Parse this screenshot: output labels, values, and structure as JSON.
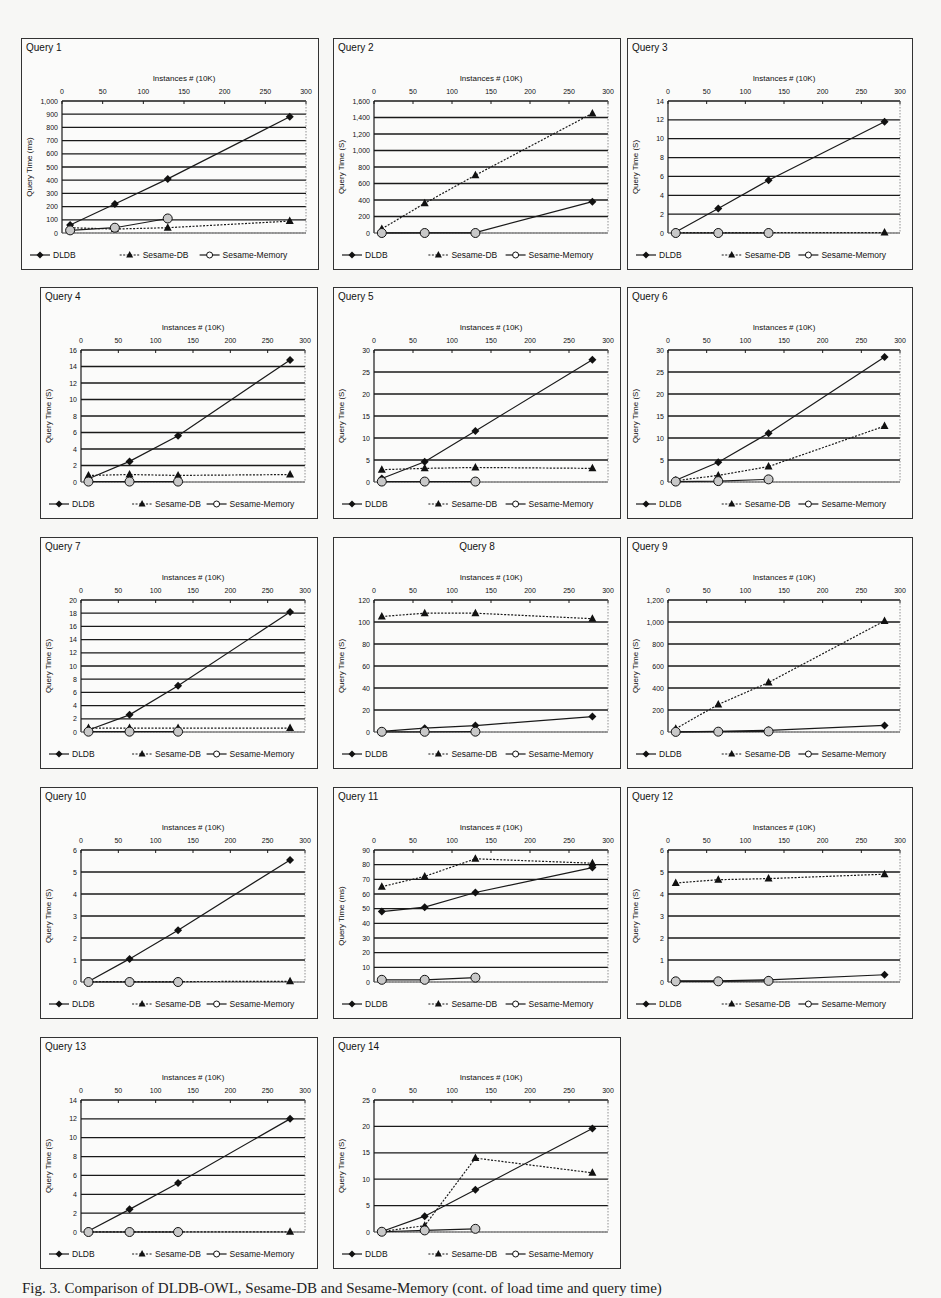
{
  "figure": {
    "caption": "Fig. 3. Comparison of DLDB-OWL, Sesame-DB and Sesame-Memory (cont. of load time and query time)",
    "legend": [
      "DLDB",
      "Sesame-DB",
      "Sesame-Memory"
    ],
    "x_axis_label": "Instances # (10K)",
    "x_ticks": [
      0,
      50,
      100,
      150,
      200,
      250,
      300
    ]
  },
  "chart_data": [
    {
      "type": "line",
      "title": "Query 1",
      "xlabel": "Instances # (10K)",
      "ylabel": "Query Time (ms)",
      "ylim": [
        0,
        1000
      ],
      "yticks": [
        0,
        100,
        200,
        300,
        400,
        500,
        600,
        700,
        800,
        900,
        1000
      ],
      "ytick_labels": [
        "0",
        "100",
        "200",
        "300",
        "400",
        "500",
        "600",
        "700",
        "800",
        "900",
        "1,000"
      ],
      "x": [
        10,
        65,
        130,
        280
      ],
      "series": [
        {
          "name": "DLDB",
          "values": [
            60,
            220,
            410,
            880
          ]
        },
        {
          "name": "Sesame-DB",
          "values": [
            40,
            30,
            40,
            90
          ]
        },
        {
          "name": "Sesame-Memory",
          "values": [
            20,
            40,
            110,
            null
          ]
        }
      ],
      "grid": true,
      "legend_position": "bottom"
    },
    {
      "type": "line",
      "title": "Query 2",
      "xlabel": "Instances # (10K)",
      "ylabel": "Query Time (S)",
      "ylim": [
        0,
        1600
      ],
      "yticks": [
        0,
        200,
        400,
        600,
        800,
        1000,
        1200,
        1400,
        1600
      ],
      "ytick_labels": [
        "0",
        "200",
        "400",
        "600",
        "800",
        "1,000",
        "1,200",
        "1,400",
        "1,600"
      ],
      "x": [
        10,
        65,
        130,
        280
      ],
      "series": [
        {
          "name": "DLDB",
          "values": [
            2,
            3,
            5,
            380
          ]
        },
        {
          "name": "Sesame-DB",
          "values": [
            50,
            360,
            700,
            1450
          ]
        },
        {
          "name": "Sesame-Memory",
          "values": [
            0,
            0,
            0,
            null
          ]
        }
      ],
      "grid": true,
      "legend_position": "bottom"
    },
    {
      "type": "line",
      "title": "Query 3",
      "xlabel": "Instances # (10K)",
      "ylabel": "Query Time (S)",
      "ylim": [
        0,
        14
      ],
      "yticks": [
        0,
        2,
        4,
        6,
        8,
        10,
        12,
        14
      ],
      "ytick_labels": [
        "0",
        "2",
        "4",
        "6",
        "8",
        "10",
        "12",
        "14"
      ],
      "x": [
        10,
        65,
        130,
        280
      ],
      "series": [
        {
          "name": "DLDB",
          "values": [
            0.1,
            2.6,
            5.6,
            11.8
          ]
        },
        {
          "name": "Sesame-DB",
          "values": [
            0.05,
            0.05,
            0.05,
            0.05
          ]
        },
        {
          "name": "Sesame-Memory",
          "values": [
            0,
            0,
            0,
            null
          ]
        }
      ],
      "grid": true,
      "legend_position": "bottom"
    },
    {
      "type": "line",
      "title": "Query 4",
      "xlabel": "Instances # (10K)",
      "ylabel": "Query Time (S)",
      "ylim": [
        0,
        16
      ],
      "yticks": [
        0,
        2,
        4,
        6,
        8,
        10,
        12,
        14,
        16
      ],
      "ytick_labels": [
        "0",
        "2",
        "4",
        "6",
        "8",
        "10",
        "12",
        "14",
        "16"
      ],
      "x": [
        10,
        65,
        130,
        280
      ],
      "series": [
        {
          "name": "DLDB",
          "values": [
            0.4,
            2.5,
            5.6,
            14.8
          ]
        },
        {
          "name": "Sesame-DB",
          "values": [
            0.8,
            0.9,
            0.8,
            0.9
          ]
        },
        {
          "name": "Sesame-Memory",
          "values": [
            0.05,
            0.05,
            0.05,
            null
          ]
        }
      ],
      "grid": true,
      "legend_position": "bottom"
    },
    {
      "type": "line",
      "title": "Query 5",
      "xlabel": "Instances # (10K)",
      "ylabel": "Query Time (S)",
      "ylim": [
        0,
        30
      ],
      "yticks": [
        0,
        5,
        10,
        15,
        20,
        25,
        30
      ],
      "ytick_labels": [
        "0",
        "5",
        "10",
        "15",
        "20",
        "25",
        "30"
      ],
      "x": [
        10,
        65,
        130,
        280
      ],
      "series": [
        {
          "name": "DLDB",
          "values": [
            0.8,
            4.6,
            11.6,
            27.8
          ]
        },
        {
          "name": "Sesame-DB",
          "values": [
            2.8,
            3.1,
            3.3,
            3.1
          ]
        },
        {
          "name": "Sesame-Memory",
          "values": [
            0.1,
            0.1,
            0.1,
            null
          ]
        }
      ],
      "grid": true,
      "legend_position": "bottom"
    },
    {
      "type": "line",
      "title": "Query 6",
      "xlabel": "Instances # (10K)",
      "ylabel": "Query Time (S)",
      "ylim": [
        0,
        30
      ],
      "yticks": [
        0,
        5,
        10,
        15,
        20,
        25,
        30
      ],
      "ytick_labels": [
        "0",
        "5",
        "10",
        "15",
        "20",
        "25",
        "30"
      ],
      "x": [
        10,
        65,
        130,
        280
      ],
      "series": [
        {
          "name": "DLDB",
          "values": [
            0.4,
            4.5,
            11.1,
            28.4
          ]
        },
        {
          "name": "Sesame-DB",
          "values": [
            0.3,
            1.5,
            3.5,
            12.7
          ]
        },
        {
          "name": "Sesame-Memory",
          "values": [
            0.1,
            0.2,
            0.6,
            null
          ]
        }
      ],
      "grid": true,
      "legend_position": "bottom"
    },
    {
      "type": "line",
      "title": "Query 7",
      "xlabel": "Instances # (10K)",
      "ylabel": "Query Time (S)",
      "ylim": [
        0,
        20
      ],
      "yticks": [
        0,
        2,
        4,
        6,
        8,
        10,
        12,
        14,
        16,
        18,
        20
      ],
      "ytick_labels": [
        "0",
        "2",
        "4",
        "6",
        "8",
        "10",
        "12",
        "14",
        "16",
        "18",
        "20"
      ],
      "x": [
        10,
        65,
        130,
        280
      ],
      "series": [
        {
          "name": "DLDB",
          "values": [
            0.3,
            2.6,
            7.0,
            18.2
          ]
        },
        {
          "name": "Sesame-DB",
          "values": [
            0.6,
            0.6,
            0.6,
            0.6
          ]
        },
        {
          "name": "Sesame-Memory",
          "values": [
            0.05,
            0.05,
            0.05,
            null
          ]
        }
      ],
      "grid": true,
      "legend_position": "bottom"
    },
    {
      "type": "line",
      "title": "Query 8",
      "xlabel": "Instances # (10K)",
      "ylabel": "Query Time (S)",
      "ylim": [
        0,
        120
      ],
      "yticks": [
        0,
        20,
        40,
        60,
        80,
        100,
        120
      ],
      "ytick_labels": [
        "0",
        "20",
        "40",
        "60",
        "80",
        "100",
        "120"
      ],
      "x": [
        10,
        65,
        130,
        280
      ],
      "series": [
        {
          "name": "DLDB",
          "values": [
            0.5,
            3.5,
            5.8,
            14
          ]
        },
        {
          "name": "Sesame-DB",
          "values": [
            105,
            108,
            108,
            103
          ]
        },
        {
          "name": "Sesame-Memory",
          "values": [
            0.2,
            0.2,
            0.3,
            null
          ]
        }
      ],
      "grid": true,
      "legend_position": "bottom"
    },
    {
      "type": "line",
      "title": "Query 9",
      "xlabel": "Instances # (10K)",
      "ylabel": "Query Time (S)",
      "ylim": [
        0,
        1200
      ],
      "yticks": [
        0,
        200,
        400,
        600,
        800,
        1000,
        1200
      ],
      "ytick_labels": [
        "0",
        "200",
        "400",
        "600",
        "800",
        "1,000",
        "1,200"
      ],
      "x": [
        10,
        65,
        130,
        280
      ],
      "series": [
        {
          "name": "DLDB",
          "values": [
            2,
            5,
            15,
            60
          ]
        },
        {
          "name": "Sesame-DB",
          "values": [
            30,
            250,
            450,
            1010
          ]
        },
        {
          "name": "Sesame-Memory",
          "values": [
            1,
            3,
            5,
            null
          ]
        }
      ],
      "grid": true,
      "legend_position": "bottom"
    },
    {
      "type": "line",
      "title": "Query 10",
      "xlabel": "Instances # (10K)",
      "ylabel": "Query Time (S)",
      "ylim": [
        0,
        6
      ],
      "yticks": [
        0,
        1,
        2,
        3,
        4,
        5,
        6
      ],
      "ytick_labels": [
        "0",
        "1",
        "2",
        "3",
        "4",
        "5",
        "6"
      ],
      "x": [
        10,
        65,
        130,
        280
      ],
      "series": [
        {
          "name": "DLDB",
          "values": [
            0.02,
            1.05,
            2.35,
            5.55
          ]
        },
        {
          "name": "Sesame-DB",
          "values": [
            0.02,
            0.02,
            0.02,
            0.03
          ]
        },
        {
          "name": "Sesame-Memory",
          "values": [
            0,
            0,
            0,
            null
          ]
        }
      ],
      "grid": true,
      "legend_position": "bottom"
    },
    {
      "type": "line",
      "title": "Query 11",
      "xlabel": "Instances # (10K)",
      "ylabel": "Query Time (ms)",
      "ylim": [
        0,
        90
      ],
      "yticks": [
        0,
        10,
        20,
        30,
        40,
        50,
        60,
        70,
        80,
        90
      ],
      "ytick_labels": [
        "0",
        "10",
        "20",
        "30",
        "40",
        "50",
        "60",
        "70",
        "80",
        "90"
      ],
      "x": [
        10,
        65,
        130,
        280
      ],
      "series": [
        {
          "name": "DLDB",
          "values": [
            48,
            51,
            61,
            78
          ]
        },
        {
          "name": "Sesame-DB",
          "values": [
            65,
            72,
            84,
            81
          ]
        },
        {
          "name": "Sesame-Memory",
          "values": [
            1.5,
            1.5,
            3,
            null
          ]
        }
      ],
      "grid": true,
      "legend_position": "bottom"
    },
    {
      "type": "line",
      "title": "Query 12",
      "xlabel": "Instances # (10K)",
      "ylabel": "Query Time (S)",
      "ylim": [
        0,
        6
      ],
      "yticks": [
        0,
        1,
        2,
        3,
        4,
        5,
        6
      ],
      "ytick_labels": [
        "0",
        "1",
        "2",
        "3",
        "4",
        "5",
        "6"
      ],
      "x": [
        10,
        65,
        130,
        280
      ],
      "series": [
        {
          "name": "DLDB",
          "values": [
            0.05,
            0.05,
            0.1,
            0.33
          ]
        },
        {
          "name": "Sesame-DB",
          "values": [
            4.5,
            4.65,
            4.7,
            4.9
          ]
        },
        {
          "name": "Sesame-Memory",
          "values": [
            0.03,
            0.03,
            0.05,
            null
          ]
        }
      ],
      "grid": true,
      "legend_position": "bottom"
    },
    {
      "type": "line",
      "title": "Query 13",
      "xlabel": "Instances # (10K)",
      "ylabel": "Query Time (S)",
      "ylim": [
        0,
        14
      ],
      "yticks": [
        0,
        2,
        4,
        6,
        8,
        10,
        12,
        14
      ],
      "ytick_labels": [
        "0",
        "2",
        "4",
        "6",
        "8",
        "10",
        "12",
        "14"
      ],
      "x": [
        10,
        65,
        130,
        280
      ],
      "series": [
        {
          "name": "DLDB",
          "values": [
            0.1,
            2.4,
            5.2,
            12
          ]
        },
        {
          "name": "Sesame-DB",
          "values": [
            0.02,
            0.02,
            0.02,
            0.02
          ]
        },
        {
          "name": "Sesame-Memory",
          "values": [
            0,
            0,
            0,
            null
          ]
        }
      ],
      "grid": true,
      "legend_position": "bottom"
    },
    {
      "type": "line",
      "title": "Query 14",
      "xlabel": "Instances # (10K)",
      "ylabel": "Query Time (S)",
      "ylim": [
        0,
        25
      ],
      "yticks": [
        0,
        5,
        10,
        15,
        20,
        25
      ],
      "ytick_labels": [
        "0",
        "5",
        "10",
        "15",
        "20",
        "25"
      ],
      "x": [
        10,
        65,
        130,
        280
      ],
      "series": [
        {
          "name": "DLDB",
          "values": [
            0.1,
            3,
            8,
            19.6
          ]
        },
        {
          "name": "Sesame-DB",
          "values": [
            0.1,
            1.2,
            14,
            11.2
          ]
        },
        {
          "name": "Sesame-Memory",
          "values": [
            0.05,
            0.3,
            0.6,
            null
          ]
        }
      ],
      "grid": true,
      "legend_position": "bottom"
    }
  ],
  "panels": [
    {
      "title": "Query 1",
      "title_centered": false
    },
    {
      "title": "Query 2",
      "title_centered": false
    },
    {
      "title": "Query 3",
      "title_centered": false
    },
    {
      "title": "Query 4",
      "title_centered": false
    },
    {
      "title": "Query 5",
      "title_centered": false
    },
    {
      "title": "Query 6",
      "title_centered": false
    },
    {
      "title": "Query 7",
      "title_centered": false
    },
    {
      "title": "Query 8",
      "title_centered": true
    },
    {
      "title": "Query 9",
      "title_centered": false
    },
    {
      "title": "Query 10",
      "title_centered": false
    },
    {
      "title": "Query 11",
      "title_centered": false
    },
    {
      "title": "Query 12",
      "title_centered": false
    },
    {
      "title": "Query 13",
      "title_centered": false
    },
    {
      "title": "Query 14",
      "title_centered": false
    }
  ],
  "colors": {
    "line": "#1a1a1a",
    "grid": "#1a1a1a",
    "memory_fill": "#c8c8c8",
    "panel_bg": "#fbfbfa",
    "page_bg": "#f7f7f5"
  }
}
